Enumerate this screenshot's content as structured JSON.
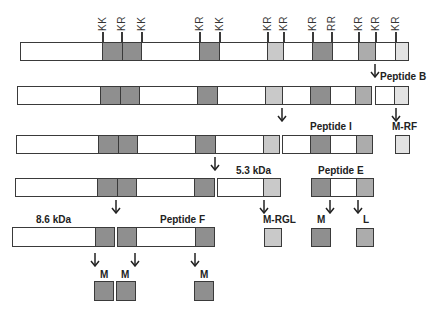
{
  "diagram": {
    "colors": {
      "dark": "#8f8f8f",
      "mid": "#acacac",
      "light": "#c9c9c9",
      "lightest": "#e3e3e3",
      "outline": "#3a3a3a"
    },
    "cleavage_sites": [
      "KK",
      "KR",
      "KK",
      "KR",
      "KK",
      "KR",
      "KR",
      "KR",
      "RR",
      "KR",
      "KR",
      "KR"
    ],
    "labels": {
      "peptide_b": "Peptide B",
      "peptide_i": "Peptide I",
      "m_rf": "M-RF",
      "kda_53": "5.3 kDa",
      "peptide_e": "Peptide E",
      "kda_86": "8.6 kDa",
      "peptide_f": "Peptide F",
      "m_rgl": "M-RGL",
      "m": "M",
      "l": "L"
    }
  }
}
